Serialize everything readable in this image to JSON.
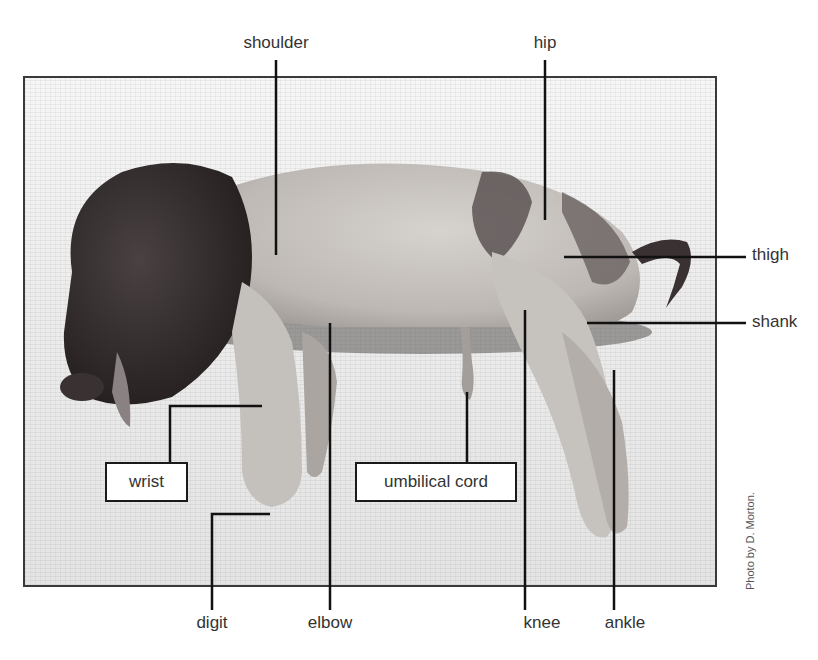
{
  "figure": {
    "credit": "Photo by D. Morton."
  },
  "labels": {
    "shoulder": "shoulder",
    "hip": "hip",
    "thigh": "thigh",
    "shank": "shank",
    "wrist": "wrist",
    "umbilical_cord": "umbilical cord",
    "digit": "digit",
    "elbow": "elbow",
    "knee": "knee",
    "ankle": "ankle"
  },
  "colors": {
    "leader_line": "#111111",
    "label_text": "#333333",
    "photo_border": "#3a3a3a",
    "background_towel": "#ececec",
    "pig_dark": "#2a2424",
    "pig_light": "#c8c4c0"
  }
}
